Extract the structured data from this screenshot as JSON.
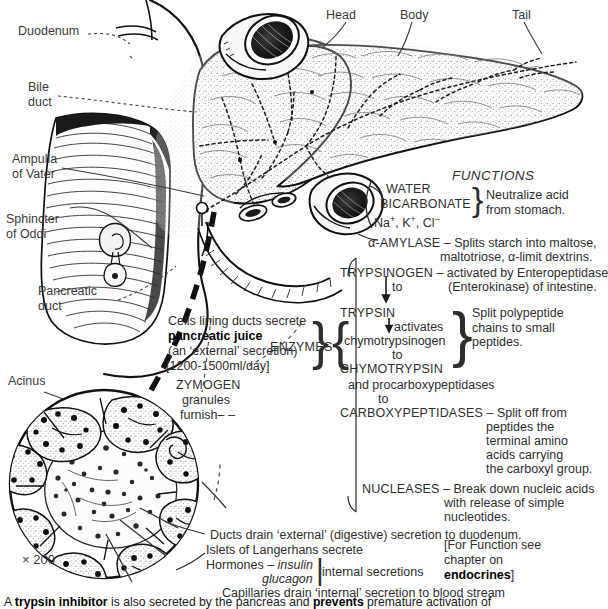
{
  "figure": {
    "magnification": "× 200"
  },
  "anatomy_labels": [
    {
      "id": "duodenum",
      "text": "Duodenum"
    },
    {
      "id": "bile-duct",
      "text": "Bile\nduct"
    },
    {
      "id": "ampulla",
      "text": "Ampulla\nof Vater"
    },
    {
      "id": "sphincter",
      "text": "Sphincter\nof Oddi"
    },
    {
      "id": "pancreatic-duct",
      "text": "Pancreatic\nduct"
    },
    {
      "id": "acinus",
      "text": "Acinus"
    },
    {
      "id": "head",
      "text": "Head"
    },
    {
      "id": "body",
      "text": "Body"
    },
    {
      "id": "tail",
      "text": "Tail"
    }
  ],
  "functions": {
    "heading": "FUNCTIONS",
    "enzymes_bracket_label": "ENZYMES",
    "water_group": {
      "lines": [
        "WATER",
        "BICARBONATE",
        "Na+, K+, Cl−"
      ],
      "effect": "Neutralize acid\nfrom stomach."
    },
    "amylase": {
      "name": "α-AMYLASE",
      "dash": "–",
      "description": "Splits starch into maltose,",
      "description2": "maltotriose, α-limit dextrins."
    },
    "trypsinogen": {
      "name": "TRYPSINOGEN",
      "dash": "–",
      "description": "activated by Enteropeptidase",
      "description2": "(Enterokinase) of intestine.",
      "arrow_label": "to"
    },
    "trypsin_chain": {
      "l1": "TRYPSIN",
      "l2": "activates",
      "l3": "chymotrypsinogen",
      "l4": "to",
      "l5": "CHYMOTRYPSIN",
      "effect": "Split polypeptide\nchains to small\npeptides."
    },
    "procarboxy": {
      "l1": "and procarboxypeptidases",
      "l2": "to",
      "name": "CARBOXYPEPTIDASES",
      "dash": "–",
      "description": "Split off from",
      "lines": [
        "peptides the",
        "terminal amino",
        "acids carrying",
        "the carboxyl group."
      ]
    },
    "nucleases": {
      "name": "NUCLEASES",
      "dash": "–",
      "description": "Break down nucleic acids",
      "lines": [
        "with release of simple",
        "nucleotides."
      ]
    }
  },
  "secretion_notes": {
    "cells_lining": "Cells lining ducts secrete",
    "pancreatic_juice": "pancreatic juice",
    "external_secretion": "(an ‘external’ secretion)",
    "volume": "[1200-1500ml/day]",
    "zymogen": "ZYMOGEN",
    "granules": "granules",
    "furnish": "furnish– –"
  },
  "bottom_notes": {
    "ducts_drain": "Ducts drain ‘external’ (digestive) secretion to duodenum.",
    "islets": "Islets of Langerhans secrete",
    "hormones_label": "Hormones –",
    "hormone1": "insulin",
    "hormone2": "glucagon",
    "internal_secretions": "internal secretions",
    "capillaries": "Capillaries drain ‘internal’ secretion to blood stream",
    "endocrine_ref": {
      "l1": "[For Function see",
      "l2": "chapter on",
      "l3": "endocrines",
      "l3_close": "]"
    }
  },
  "footnote": {
    "lead": "A ",
    "bold1": "trypsin inhibitor",
    "mid": " is also secreted by the pancreas and ",
    "bold2": "prevents",
    "tail": " premature activation of"
  },
  "colors": {
    "ink": "#2b2b2b",
    "label": "#3a3a3a",
    "paper": "#ffffff",
    "bold_ink": "#000000"
  }
}
